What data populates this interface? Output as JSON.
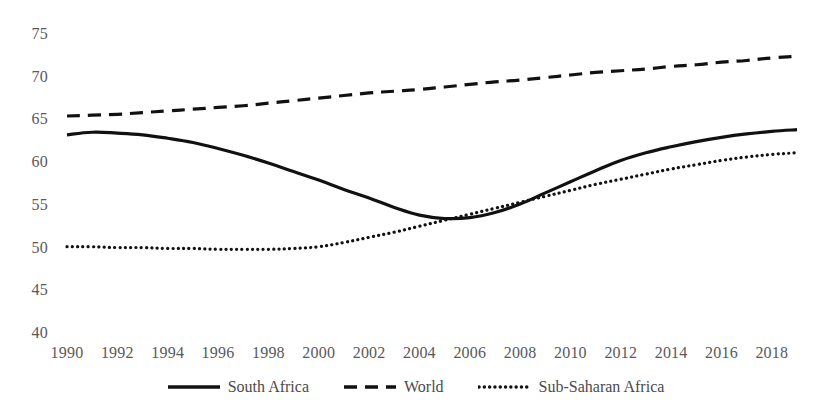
{
  "chart_data": {
    "type": "line",
    "title": "",
    "subtitle": "",
    "xlabel": "",
    "ylabel": "",
    "xlim": [
      1990,
      2019
    ],
    "ylim": [
      40,
      75
    ],
    "grid": false,
    "legend_position": "bottom-center",
    "x": [
      1990,
      1991,
      1992,
      1993,
      1994,
      1995,
      1996,
      1997,
      1998,
      1999,
      2000,
      2001,
      2002,
      2003,
      2004,
      2005,
      2006,
      2007,
      2008,
      2009,
      2010,
      2011,
      2012,
      2013,
      2014,
      2015,
      2016,
      2017,
      2018,
      2019
    ],
    "x_tick_labels": [
      "1990",
      "1992",
      "1994",
      "1996",
      "1998",
      "2000",
      "2002",
      "2004",
      "2006",
      "2008",
      "2010",
      "2012",
      "2014",
      "2016",
      "2018"
    ],
    "x_ticks": [
      1990,
      1992,
      1994,
      1996,
      1998,
      2000,
      2002,
      2004,
      2006,
      2008,
      2010,
      2012,
      2014,
      2016,
      2018
    ],
    "y_ticks": [
      40,
      45,
      50,
      55,
      60,
      65,
      70,
      75
    ],
    "y_tick_labels": [
      "40",
      "45",
      "50",
      "55",
      "60",
      "65",
      "70",
      "75"
    ],
    "series": [
      {
        "name": "South Africa",
        "style": "solid",
        "color": "#111111",
        "width": 3.2,
        "values": [
          63.2,
          63.5,
          63.4,
          63.2,
          62.8,
          62.3,
          61.6,
          60.8,
          59.9,
          58.9,
          57.9,
          56.8,
          55.8,
          54.7,
          53.8,
          53.4,
          53.5,
          54.1,
          55.1,
          56.4,
          57.7,
          59.0,
          60.2,
          61.1,
          61.8,
          62.4,
          62.9,
          63.3,
          63.6,
          63.8
        ]
      },
      {
        "name": "World",
        "style": "dashed",
        "color": "#111111",
        "width": 3.2,
        "values": [
          65.4,
          65.5,
          65.6,
          65.8,
          66.0,
          66.2,
          66.4,
          66.6,
          66.9,
          67.2,
          67.5,
          67.8,
          68.1,
          68.3,
          68.5,
          68.8,
          69.1,
          69.4,
          69.6,
          69.9,
          70.2,
          70.5,
          70.7,
          70.9,
          71.2,
          71.4,
          71.7,
          71.9,
          72.2,
          72.4
        ]
      },
      {
        "name": "Sub-Saharan Africa",
        "style": "dotted",
        "color": "#111111",
        "width": 3.2,
        "values": [
          50.1,
          50.1,
          50.0,
          50.0,
          49.9,
          49.9,
          49.8,
          49.8,
          49.8,
          49.9,
          50.1,
          50.6,
          51.2,
          51.8,
          52.5,
          53.2,
          53.9,
          54.6,
          55.3,
          56.0,
          56.7,
          57.4,
          58.0,
          58.6,
          59.2,
          59.7,
          60.2,
          60.6,
          60.9,
          61.1
        ]
      }
    ]
  },
  "legend": {
    "items": [
      {
        "label": "South Africa",
        "style": "solid"
      },
      {
        "label": "World",
        "style": "dashed"
      },
      {
        "label": "Sub-Saharan Africa",
        "style": "dotted"
      }
    ]
  }
}
